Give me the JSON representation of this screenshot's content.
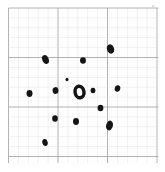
{
  "figure": {
    "title": "",
    "background_color": "#ffffff",
    "paper_color": "#fefefe",
    "ink_color": "#141414"
  },
  "chart_data": {
    "type": "scatter",
    "title": "",
    "xlabel": "",
    "ylabel": "",
    "grid": true,
    "legend": null,
    "axis_units": "grid cells",
    "xlim": [
      0,
      15
    ],
    "ylim": [
      0,
      15
    ],
    "grid_style": {
      "minor_spacing_px": 9.9,
      "major_spacing_cells": 5,
      "minor_color": "#d8d8d8",
      "major_color": "#9a9a9a",
      "origin_px": [
        8.5,
        8.0
      ],
      "extent_px": [
        158.5,
        163.0
      ]
    },
    "series": [
      {
        "name": "data points",
        "marker": "ink-blob",
        "points": [
          {
            "id": "p1",
            "x_px": 110.5,
            "y_px": 49.0,
            "rx": 3.6,
            "ry": 4.8,
            "rot": -18
          },
          {
            "id": "p2",
            "x_px": 45.5,
            "y_px": 59.5,
            "rx": 3.2,
            "ry": 4.6,
            "rot": -22
          },
          {
            "id": "p3",
            "x_px": 83.0,
            "y_px": 60.5,
            "rx": 2.9,
            "ry": 3.3,
            "rot": 0
          },
          {
            "id": "p4",
            "x_px": 67.0,
            "y_px": 79.5,
            "rx": 1.5,
            "ry": 1.7,
            "rot": 0
          },
          {
            "id": "p5",
            "x_px": 117.5,
            "y_px": 88.5,
            "rx": 2.8,
            "ry": 3.2,
            "rot": 12
          },
          {
            "id": "p6",
            "x_px": 55.5,
            "y_px": 90.5,
            "rx": 2.9,
            "ry": 3.4,
            "rot": -8
          },
          {
            "id": "p7",
            "x_px": 29.5,
            "y_px": 93.5,
            "rx": 3.0,
            "ry": 3.4,
            "rot": 0
          },
          {
            "id": "p8",
            "x_px": 93.0,
            "y_px": 90.5,
            "rx": 2.4,
            "ry": 2.8,
            "rot": 0
          },
          {
            "id": "p9",
            "x_px": 100.5,
            "y_px": 108.0,
            "rx": 2.9,
            "ry": 3.3,
            "rot": 0
          },
          {
            "id": "p10",
            "x_px": 55.0,
            "y_px": 118.5,
            "rx": 2.8,
            "ry": 3.2,
            "rot": 0
          },
          {
            "id": "p11",
            "x_px": 76.0,
            "y_px": 121.5,
            "rx": 3.0,
            "ry": 3.4,
            "rot": 0
          },
          {
            "id": "p12",
            "x_px": 109.5,
            "y_px": 125.5,
            "rx": 3.4,
            "ry": 5.0,
            "rot": 14
          },
          {
            "id": "p13",
            "x_px": 45.0,
            "y_px": 142.5,
            "rx": 2.7,
            "ry": 3.6,
            "rot": -12
          }
        ]
      },
      {
        "name": "centre marker",
        "marker": "ring",
        "points": [
          {
            "id": "c1",
            "x_px": 79.5,
            "y_px": 92.0,
            "rx": 6.2,
            "ry": 7.6,
            "rot": -10,
            "hole_rx": 2.7,
            "hole_ry": 4.1
          }
        ]
      }
    ],
    "annotations": []
  }
}
